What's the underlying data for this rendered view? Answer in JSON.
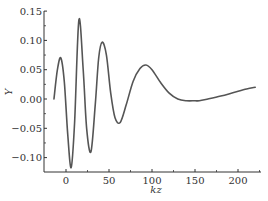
{
  "chart_data": {
    "type": "line",
    "title": "",
    "xlabel": "kz",
    "ylabel": "Y",
    "xlim": [
      -25,
      227
    ],
    "ylim": [
      -0.125,
      0.15
    ],
    "grid": false,
    "legend": null,
    "x_ticks": [
      0,
      50,
      100,
      150,
      200
    ],
    "x_tick_labels": [
      "0",
      "50",
      "100",
      "150",
      "200"
    ],
    "y_ticks": [
      -0.1,
      -0.05,
      0.0,
      0.05,
      0.1,
      0.15
    ],
    "y_tick_labels": [
      "−0.10",
      "−0.05",
      "0.00",
      "0.05",
      "0.10",
      "0.15"
    ],
    "series": [
      {
        "name": "Y(kz)",
        "color": "#555555",
        "x": [
          -14,
          -10,
          -6,
          -2,
          2,
          6,
          10,
          15,
          20,
          24,
          29,
          34,
          38,
          42,
          47,
          52,
          57,
          63,
          70,
          78,
          86,
          93,
          100,
          110,
          120,
          130,
          140,
          150,
          155,
          165,
          180,
          195,
          210,
          220
        ],
        "y": [
          0.0,
          0.05,
          0.07,
          0.03,
          -0.06,
          -0.117,
          -0.04,
          0.135,
          0.05,
          -0.05,
          -0.09,
          -0.01,
          0.07,
          0.097,
          0.075,
          0.01,
          -0.032,
          -0.04,
          -0.01,
          0.03,
          0.052,
          0.058,
          0.05,
          0.028,
          0.01,
          0.0,
          -0.003,
          -0.003,
          -0.003,
          0.0,
          0.005,
          0.011,
          0.017,
          0.02
        ]
      }
    ]
  }
}
